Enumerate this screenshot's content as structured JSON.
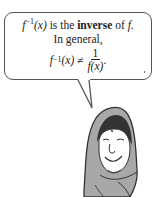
{
  "bubble": {
    "line1_prefix_func": "f",
    "line1_sup": "−1",
    "line1_arg": "(x)",
    "line1_text": " is the ",
    "line1_bold": "inverse",
    "line1_suffix": " of ",
    "line1_f": "f",
    "line1_end": ".",
    "line2": "In general,",
    "eq_func": "f",
    "eq_sup": "−1",
    "eq_arg": "(x) ≠",
    "eq_num": "1",
    "eq_den": "f(x)",
    "eq_end": "."
  },
  "colors": {
    "outline": "#555555",
    "scarf": "#a8a8a8",
    "dark": "#333333"
  }
}
